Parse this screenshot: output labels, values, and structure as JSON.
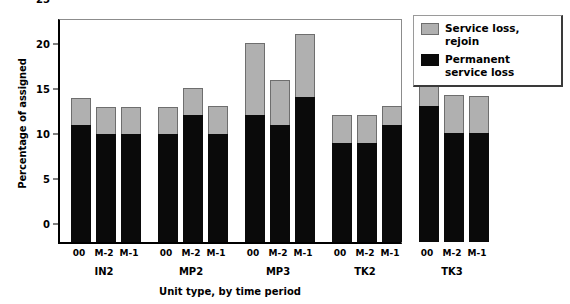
{
  "chart_data": {
    "type": "bar",
    "subtype": "stacked",
    "title": "",
    "xlabel": "Unit type, by time period",
    "ylabel": "Percentage of assigned",
    "ylim": [
      0,
      25
    ],
    "yticks": [
      0,
      5,
      10,
      15,
      20,
      25
    ],
    "grid": false,
    "legend_position": "top-right",
    "groups": [
      "IN2",
      "MP2",
      "MP3",
      "TK2",
      "TK3"
    ],
    "categories": [
      "00",
      "M-2",
      "M-1",
      "00",
      "M-2",
      "M-1",
      "00",
      "M-2",
      "M-1",
      "00",
      "M-2",
      "M-1",
      "00",
      "M-2",
      "M-1"
    ],
    "series": [
      {
        "name": "Permanent service loss",
        "color": "#0a0a0a",
        "values": [
          13.0,
          12.0,
          12.0,
          12.0,
          14.1,
          12.0,
          14.1,
          13.0,
          16.1,
          11.0,
          11.0,
          13.0,
          15.1,
          12.1,
          12.1
        ]
      },
      {
        "name": "Service loss, rejoin",
        "color": "#b0b0b0",
        "values": [
          3.0,
          3.0,
          3.0,
          3.0,
          3.0,
          3.1,
          8.0,
          5.0,
          7.0,
          3.1,
          3.1,
          2.1,
          6.0,
          4.2,
          4.1
        ]
      }
    ],
    "totals": [
      16.0,
      15.0,
      15.0,
      15.0,
      17.1,
      15.1,
      22.1,
      18.0,
      23.1,
      14.1,
      14.1,
      15.1,
      21.1,
      16.3,
      16.2
    ]
  },
  "legend": {
    "items": [
      {
        "label": "Service loss, rejoin",
        "swatch": "grey"
      },
      {
        "label": "Permanent service loss",
        "swatch": "black"
      }
    ]
  }
}
